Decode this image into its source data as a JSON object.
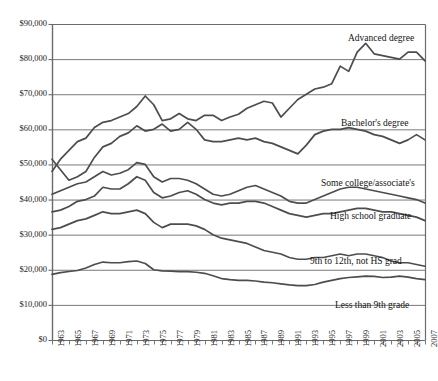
{
  "chart_data": {
    "type": "line",
    "title": "",
    "subtitle": "",
    "xlabel": "",
    "ylabel": "",
    "xlim": [
      1963,
      2007
    ],
    "ylim": [
      0,
      90000
    ],
    "grid": true,
    "grid_axis": "y",
    "legend_position": "inline-right-of-series",
    "y_tick_labels": [
      "$90,000",
      "$80,000",
      "$70,000",
      "$60,000",
      "$50,000",
      "$40,000",
      "$30,000",
      "$20,000",
      "$10,000",
      "$0"
    ],
    "y_tick_values": [
      90000,
      80000,
      70000,
      60000,
      50000,
      40000,
      30000,
      20000,
      10000,
      0
    ],
    "x_tick_labels": [
      "1963",
      "1965",
      "1967",
      "1969",
      "1971",
      "1973",
      "1975",
      "1977",
      "1979",
      "1981",
      "1983",
      "1985",
      "1987",
      "1989",
      "1991",
      "1993",
      "1995",
      "1997",
      "1999",
      "2001",
      "2003",
      "2005",
      "2007"
    ],
    "x_minor_ticks_every": 1,
    "x": [
      1963,
      1964,
      1965,
      1966,
      1967,
      1968,
      1969,
      1970,
      1971,
      1972,
      1973,
      1974,
      1975,
      1976,
      1977,
      1978,
      1979,
      1980,
      1981,
      1982,
      1983,
      1984,
      1985,
      1986,
      1987,
      1988,
      1989,
      1990,
      1991,
      1992,
      1993,
      1994,
      1995,
      1996,
      1997,
      1998,
      1999,
      2000,
      2001,
      2002,
      2003,
      2004,
      2005,
      2006,
      2007
    ],
    "series": [
      {
        "name": "Advanced degree",
        "color": "#4d4d4d",
        "values": [
          48000,
          51500,
          54000,
          56500,
          57500,
          60500,
          62000,
          62500,
          63500,
          64500,
          66500,
          69500,
          67000,
          62500,
          63000,
          64500,
          63000,
          62500,
          64000,
          64000,
          62500,
          63500,
          64300,
          66000,
          67000,
          68000,
          67500,
          63500,
          66000,
          68500,
          70000,
          71500,
          72000,
          73000,
          78000,
          76500,
          82000,
          84500,
          81500,
          81000,
          80500,
          80000,
          82000,
          82000,
          79500
        ]
      },
      {
        "name": "Bachelor's degree",
        "color": "#4d4d4d",
        "values": [
          51500,
          48500,
          45500,
          46500,
          48000,
          52000,
          55000,
          56000,
          58000,
          59000,
          61000,
          59500,
          60000,
          61500,
          59500,
          60000,
          62000,
          60000,
          57000,
          56500,
          56500,
          57000,
          57500,
          57000,
          57500,
          56500,
          56000,
          55000,
          54000,
          53000,
          55500,
          58500,
          59500,
          60000,
          60000,
          60500,
          60000,
          59500,
          58500,
          58000,
          57000,
          56000,
          57000,
          58500,
          57000
        ]
      },
      {
        "name": "Some college/associate's",
        "color": "#4d4d4d",
        "values": [
          41500,
          42500,
          43500,
          44500,
          45000,
          46500,
          48000,
          47000,
          47500,
          48500,
          50500,
          50000,
          46500,
          45000,
          46000,
          46000,
          45500,
          44500,
          43000,
          41500,
          41000,
          41500,
          42500,
          43500,
          44000,
          43000,
          42000,
          41000,
          39500,
          39000,
          39000,
          40000,
          41000,
          42000,
          43000,
          43500,
          43500,
          43000,
          42500,
          42000,
          41500,
          41000,
          40500,
          40000,
          39000
        ]
      },
      {
        "name": "High school graduate",
        "color": "#4d4d4d",
        "values": [
          36500,
          37000,
          38000,
          39500,
          40000,
          41000,
          43500,
          43000,
          43000,
          44500,
          46500,
          45500,
          42000,
          40500,
          41000,
          42000,
          42500,
          41500,
          40000,
          39000,
          38500,
          39000,
          39000,
          39500,
          39500,
          39000,
          38000,
          37000,
          36000,
          35500,
          35000,
          35500,
          36000,
          36000,
          36500,
          37000,
          37500,
          37500,
          37000,
          36500,
          36500,
          36000,
          35500,
          35000,
          34000
        ]
      },
      {
        "name": "9th to 12th, not HS grad",
        "color": "#4d4d4d",
        "values": [
          31500,
          32000,
          33000,
          34000,
          34500,
          35500,
          36500,
          36000,
          36000,
          36500,
          37000,
          36000,
          33500,
          32000,
          33000,
          33000,
          33000,
          32500,
          31500,
          30000,
          29000,
          28500,
          28000,
          27500,
          26500,
          25500,
          25000,
          24500,
          23500,
          23000,
          23000,
          23500,
          23500,
          24000,
          24500,
          24000,
          24500,
          24500,
          24000,
          23500,
          22500,
          22000,
          22000,
          21500,
          21000
        ]
      },
      {
        "name": "Less than 9th grade",
        "color": "#4d4d4d",
        "values": [
          18700,
          19200,
          19500,
          19800,
          20500,
          21500,
          22200,
          22000,
          22000,
          22300,
          22500,
          21800,
          20000,
          19700,
          19600,
          19500,
          19500,
          19300,
          19000,
          18300,
          17500,
          17200,
          17000,
          17000,
          16800,
          16500,
          16300,
          16000,
          15700,
          15500,
          15500,
          15800,
          16500,
          17000,
          17500,
          17800,
          18000,
          18200,
          18100,
          17800,
          17900,
          18200,
          17900,
          17500,
          17200
        ]
      }
    ],
    "series_label_positions": [
      {
        "name": "Advanced degree",
        "x_px": 348,
        "y_px": 33
      },
      {
        "name": "Bachelor's degree",
        "x_px": 341,
        "y_px": 118
      },
      {
        "name": "Some college/associate's",
        "x_px": 321,
        "y_px": 178
      },
      {
        "name": "High school graduate",
        "x_px": 330,
        "y_px": 211
      },
      {
        "name": "9th to 12th, not HS grad",
        "x_px": 310,
        "y_px": 256
      },
      {
        "name": "Less than 9th grade",
        "x_px": 335,
        "y_px": 300
      }
    ]
  },
  "style": {
    "line_color": "#4d4d4d",
    "axis_color": "#6b6b6b",
    "grid_color": "#7a7a7a",
    "text_color": "#1a1a1a",
    "background": "#ffffff"
  },
  "geometry": {
    "plot_left": 52,
    "plot_right": 425,
    "plot_top": 24,
    "plot_bottom": 340
  }
}
